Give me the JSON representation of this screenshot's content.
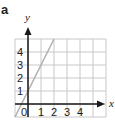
{
  "panel": {
    "label": "a"
  },
  "chart_data": {
    "type": "line",
    "title": "",
    "xlabel": "x",
    "ylabel": "y",
    "xlim": [
      -1,
      5
    ],
    "ylim": [
      -1,
      5
    ],
    "grid": true,
    "x_ticks": [
      "0",
      "1",
      "2",
      "3",
      "4"
    ],
    "y_ticks": [
      "1",
      "2",
      "3",
      "4"
    ],
    "series": [
      {
        "name": "y = 2x + 1",
        "x": [
          -1,
          0,
          1,
          2
        ],
        "y": [
          -1,
          1,
          3,
          5
        ],
        "color": "#b0b0b0"
      }
    ]
  }
}
